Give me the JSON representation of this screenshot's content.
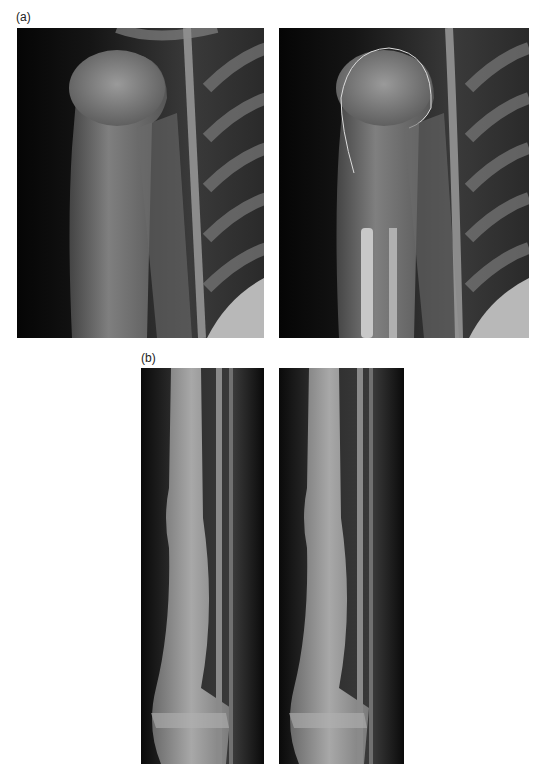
{
  "figure": {
    "panels": [
      {
        "label": "(a)",
        "description": "Shoulder / proximal humerus radiographs",
        "images": [
          {
            "name": "shoulder-xray-original",
            "annotated": false
          },
          {
            "name": "shoulder-xray-outlined",
            "annotated": true,
            "annotation": "humeral head contour outline"
          }
        ]
      },
      {
        "label": "(b)",
        "description": "Lower leg (tibia/fibula) radiographs",
        "images": [
          {
            "name": "leg-xray-1"
          },
          {
            "name": "leg-xray-2"
          }
        ]
      }
    ]
  }
}
